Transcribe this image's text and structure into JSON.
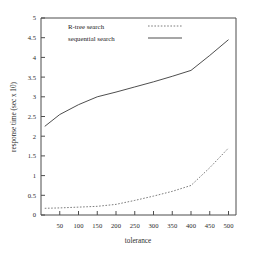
{
  "chart_data": {
    "type": "line",
    "title": "",
    "xlabel": "tolerance",
    "ylabel": "response time (sec x 10)",
    "xlim": [
      0,
      520
    ],
    "ylim": [
      0,
      5
    ],
    "xticks": [
      50,
      100,
      150,
      200,
      250,
      300,
      350,
      400,
      450,
      500
    ],
    "yticks": [
      0,
      0.5,
      1,
      1.5,
      2,
      2.5,
      3,
      3.5,
      4,
      4.5,
      5
    ],
    "grid": false,
    "legend_position": "top-center-inside",
    "series": [
      {
        "name": "R-tree search",
        "style": "dashed",
        "color": "#6e6e6e",
        "x": [
          10,
          50,
          100,
          150,
          200,
          250,
          300,
          350,
          400,
          450,
          500
        ],
        "values": [
          0.17,
          0.18,
          0.2,
          0.22,
          0.27,
          0.37,
          0.48,
          0.6,
          0.75,
          1.2,
          1.7
        ]
      },
      {
        "name": "sequential search",
        "style": "solid",
        "color": "#3a3a3a",
        "x": [
          10,
          50,
          100,
          150,
          200,
          250,
          300,
          350,
          400,
          450,
          500
        ],
        "values": [
          2.25,
          2.55,
          2.8,
          3.0,
          3.12,
          3.25,
          3.38,
          3.52,
          3.67,
          4.05,
          4.45
        ]
      }
    ]
  },
  "axis": {
    "x_title": "tolerance",
    "y_title": "response time (sec x 10)",
    "x_tick_labels": [
      "50",
      "100",
      "150",
      "200",
      "250",
      "300",
      "350",
      "400",
      "450",
      "500"
    ],
    "y_tick_labels": [
      "0",
      "0.5",
      "1",
      "1.5",
      "2",
      "2.5",
      "3",
      "3.5",
      "4",
      "4.5",
      "5"
    ]
  },
  "legend": {
    "entries": [
      {
        "label": "R-tree search",
        "style": "dashed"
      },
      {
        "label": "sequential search",
        "style": "solid"
      }
    ]
  }
}
